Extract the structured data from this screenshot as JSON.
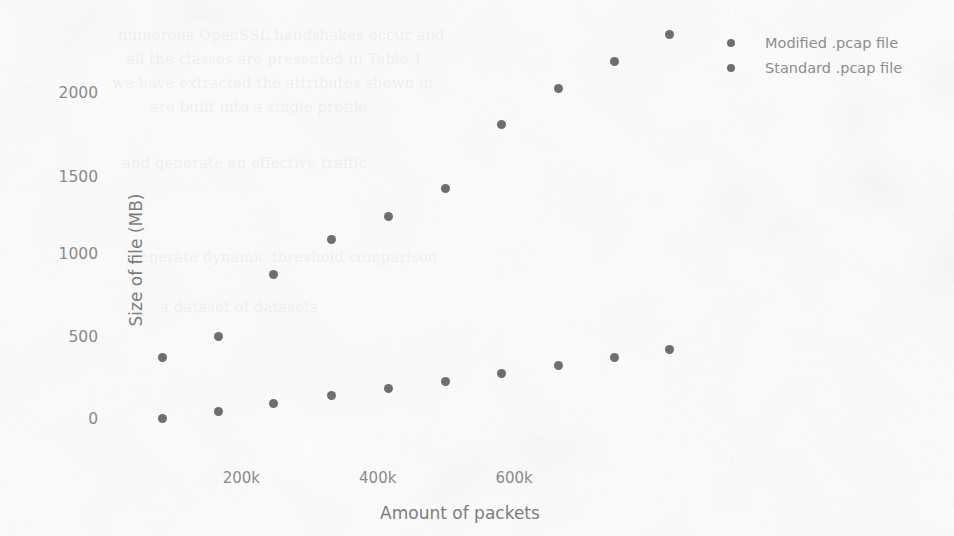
{
  "chart_data": {
    "type": "scatter",
    "title": "",
    "xlabel": "Amount of packets",
    "ylabel": "Size of file (MB)",
    "xlim": [
      0,
      880000
    ],
    "ylim": [
      -40,
      2330
    ],
    "xticks": [
      200000,
      400000,
      600000
    ],
    "xticklabels": [
      "200k",
      "400k",
      "600k"
    ],
    "yticks": [
      0,
      500,
      1000,
      1500,
      2000
    ],
    "yticklabels": [
      "0",
      "500",
      "1000",
      "1500",
      "2000"
    ],
    "grid": false,
    "legend_position": "right",
    "series": [
      {
        "name": "Modified .pcap file",
        "color": "#6e6e6e",
        "x": [
          85000,
          166000,
          247000,
          332000,
          416000,
          500000,
          581000,
          665000,
          747000,
          828000
        ],
        "y": [
          400,
          520,
          880,
          1080,
          1210,
          1370,
          1740,
          1950,
          2100,
          2260
        ]
      },
      {
        "name": "Standard .pcap file",
        "color": "#6e6e6e",
        "x": [
          85000,
          166000,
          247000,
          332000,
          416000,
          500000,
          581000,
          665000,
          747000,
          828000
        ],
        "y": [
          50,
          90,
          135,
          180,
          220,
          262,
          310,
          355,
          400,
          445
        ]
      }
    ]
  },
  "legend": {
    "items": [
      {
        "label": "Modified .pcap file",
        "marker": "filled-circle-marker"
      },
      {
        "label": "Standard .pcap file",
        "marker": "filled-circle-marker"
      }
    ]
  },
  "axes": {
    "x_label": "Amount of packets",
    "y_label": "Size of file (MB)",
    "x_tick_labels": [
      "200k",
      "400k",
      "600k"
    ],
    "y_tick_labels": [
      "2000",
      "1500",
      "1000",
      "500",
      "0"
    ]
  },
  "background_ghost_text": [
    "numerous OpenSSL handshakes occur and",
    "all the classes are presented in Table 1",
    "we have extracted the attributes shown in",
    "are built into a single profile",
    "and generate an effective traffic",
    "generate dynamic threshold comparison",
    "a dataset of datasets"
  ]
}
